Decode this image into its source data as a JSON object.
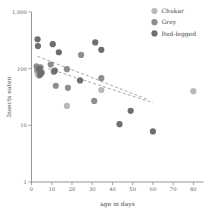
{
  "chart_data": {
    "type": "scatter",
    "title": "",
    "xlabel": "age in days",
    "ylabel": "Insects eaten",
    "yscale": "log",
    "xscale": "linear",
    "xlim": [
      0,
      85
    ],
    "ylim": [
      1,
      1000
    ],
    "xticks": [
      0,
      10,
      20,
      30,
      40,
      50,
      60,
      70,
      80
    ],
    "xticklabels": [
      "0",
      "10",
      "20",
      "30",
      "40",
      "50",
      "60",
      "70",
      "80"
    ],
    "yticks": [
      1,
      10,
      100,
      1000
    ],
    "yticklabels": [
      "1",
      "10",
      "100",
      "1,000"
    ],
    "grid": false,
    "legend_position": "top-right",
    "series": [
      {
        "name": "Chukar",
        "color": "#b9b9b9",
        "points": [
          {
            "x": 3.0,
            "y": 82
          },
          {
            "x": 3.5,
            "y": 75
          },
          {
            "x": 17.5,
            "y": 22
          },
          {
            "x": 34.5,
            "y": 42
          },
          {
            "x": 80.0,
            "y": 40
          }
        ]
      },
      {
        "name": "Grey",
        "color": "#8e8e8e",
        "points": [
          {
            "x": 2.5,
            "y": 110
          },
          {
            "x": 2.8,
            "y": 95
          },
          {
            "x": 4.5,
            "y": 105
          },
          {
            "x": 9.5,
            "y": 118
          },
          {
            "x": 11.0,
            "y": 88
          },
          {
            "x": 12.0,
            "y": 50
          },
          {
            "x": 17.5,
            "y": 98
          },
          {
            "x": 18.0,
            "y": 46
          },
          {
            "x": 24.5,
            "y": 175
          },
          {
            "x": 31.0,
            "y": 27
          },
          {
            "x": 34.5,
            "y": 68
          }
        ]
      },
      {
        "name": "Red-legged",
        "color": "#6e6e6e",
        "points": [
          {
            "x": 3.0,
            "y": 330
          },
          {
            "x": 3.2,
            "y": 250
          },
          {
            "x": 3.8,
            "y": 100
          },
          {
            "x": 4.2,
            "y": 78
          },
          {
            "x": 5.0,
            "y": 85
          },
          {
            "x": 10.5,
            "y": 270
          },
          {
            "x": 11.5,
            "y": 92
          },
          {
            "x": 13.5,
            "y": 195
          },
          {
            "x": 24.0,
            "y": 62
          },
          {
            "x": 31.5,
            "y": 290
          },
          {
            "x": 34.5,
            "y": 215
          },
          {
            "x": 43.5,
            "y": 10.5
          },
          {
            "x": 49.0,
            "y": 18
          },
          {
            "x": 60.0,
            "y": 7.8
          }
        ]
      }
    ],
    "trend_lines": [
      {
        "name": "upper-trend",
        "x0": 3.0,
        "y0": 165,
        "x1": 57.0,
        "y1": 29
      },
      {
        "name": "lower-trend",
        "x0": 8.5,
        "y0": 100,
        "x1": 60.0,
        "y1": 25
      }
    ]
  },
  "legend": {
    "items": [
      {
        "label": "Chukar",
        "color": "#b9b9b9"
      },
      {
        "label": "Grey",
        "color": "#8e8e8e"
      },
      {
        "label": "Red-legged",
        "color": "#6e6e6e"
      }
    ]
  }
}
